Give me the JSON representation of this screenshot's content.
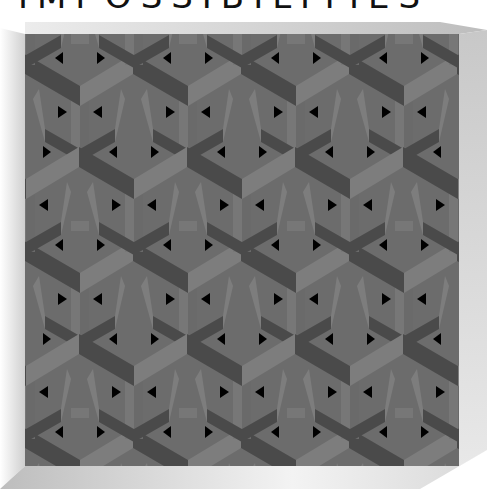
{
  "title": "IMPOSSIBILITIES",
  "artwork": {
    "subject": "impossible-cube-tessellation",
    "colors": {
      "light_face": "#7c7c7c",
      "mid_face": "#656565",
      "dark_face": "#4a4a4a",
      "holes": "#000000",
      "bevel_top": "#d6d6d6",
      "bevel_right": "#c4c4c4",
      "bevel_bottom": "#e2e2e2"
    }
  }
}
